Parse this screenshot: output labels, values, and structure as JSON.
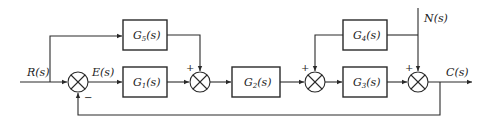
{
  "signals": {
    "input": "R(s)",
    "error": "E(s)",
    "disturbance": "N(s)",
    "output": "C(s)"
  },
  "blocks": [
    {
      "id": "G5",
      "base": "G",
      "sub": "5",
      "tail": "(s)"
    },
    {
      "id": "G1",
      "base": "G",
      "sub": "1",
      "tail": "(s)"
    },
    {
      "id": "G2",
      "base": "G",
      "sub": "2",
      "tail": "(s)"
    },
    {
      "id": "G4",
      "base": "G",
      "sub": "4",
      "tail": "(s)"
    },
    {
      "id": "G3",
      "base": "G",
      "sub": "3",
      "tail": "(s)"
    }
  ],
  "signs": {
    "sum1_feedback": "−",
    "sum2_top": "+",
    "sum3_top": "+",
    "sum4_top": "+"
  },
  "colors": {
    "line": "#2a2a2a",
    "background": "#ffffff"
  }
}
